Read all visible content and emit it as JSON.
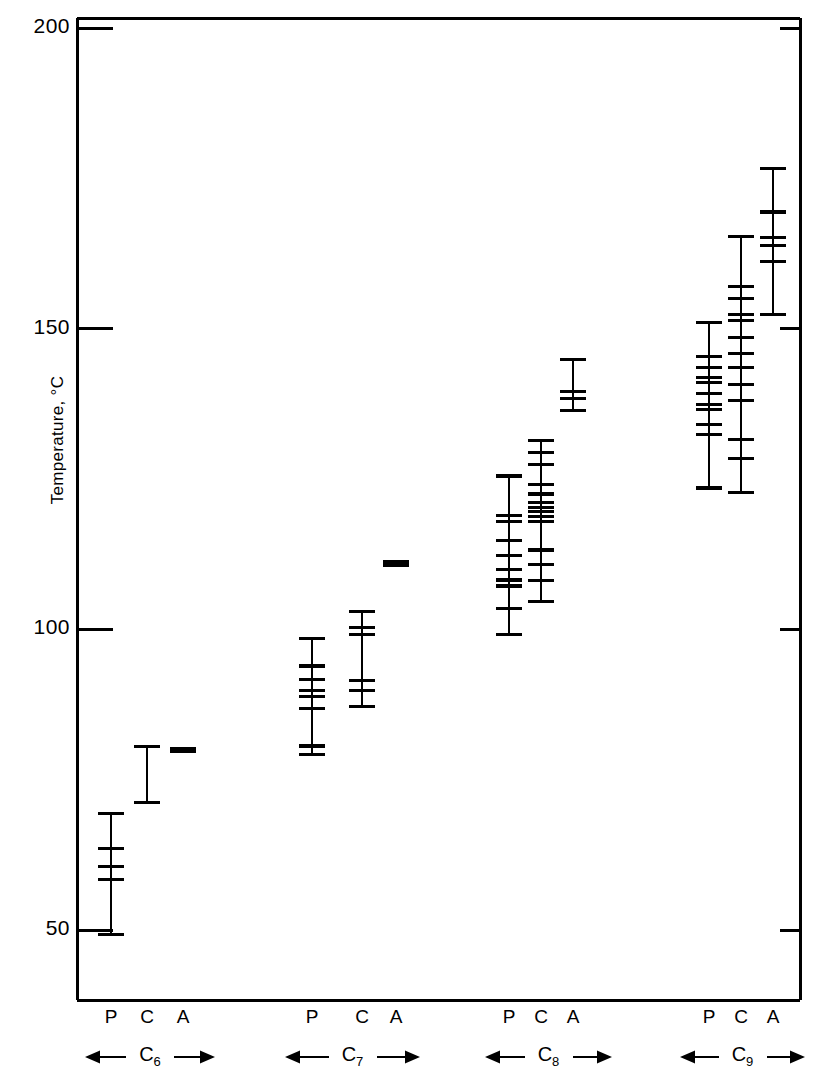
{
  "chart_data": {
    "type": "scatter",
    "subtype": "tick-strip-plot",
    "title": "",
    "xlabel": "",
    "ylabel": "Temperature, °C",
    "ylim": [
      38,
      203
    ],
    "yticks": [
      50,
      100,
      150,
      200
    ],
    "ytick_labels": [
      "50",
      "100",
      "150",
      "200"
    ],
    "grid": false,
    "legend": null,
    "x_group_labels": [
      "C6",
      "C7",
      "C8",
      "C9"
    ],
    "x_group_labels_display": [
      "C₆",
      "C₇",
      "C₈",
      "C₉"
    ],
    "x_subcategories": [
      "P",
      "C",
      "A"
    ],
    "series": [
      {
        "name": "C6 P",
        "group": "C6",
        "sub": "P",
        "range": [
          49.2,
          69.4
        ],
        "values": [
          69.4,
          63.6,
          60.6,
          58.4,
          49.2
        ]
      },
      {
        "name": "C6 C",
        "group": "C6",
        "sub": "C",
        "range": [
          71.2,
          80.5
        ],
        "values": [
          80.5,
          71.2
        ]
      },
      {
        "name": "C6 A",
        "group": "C6",
        "sub": "A",
        "range": [
          79.7,
          80.2
        ],
        "values": [
          80.2,
          79.7
        ]
      },
      {
        "name": "C7 P",
        "group": "C7",
        "sub": "P",
        "range": [
          79.2,
          98.5
        ],
        "values": [
          98.5,
          93.9,
          91.6,
          89.9,
          88.9,
          86.9,
          80.6,
          79.2
        ]
      },
      {
        "name": "C7 C",
        "group": "C7",
        "sub": "C",
        "range": [
          87.5,
          103.0
        ],
        "values": [
          103.0,
          100.3,
          99.2,
          91.5,
          89.9,
          87.1
        ]
      },
      {
        "name": "C7 A",
        "group": "C7",
        "sub": "A",
        "range": [
          110.6,
          111.2
        ],
        "values": [
          111.2,
          110.6
        ]
      },
      {
        "name": "C8 P",
        "group": "C8",
        "sub": "P",
        "range": [
          99.1,
          125.5
        ],
        "values": [
          125.5,
          118.9,
          117.9,
          114.8,
          112.3,
          110.0,
          108.2,
          107.2,
          103.4,
          99.1
        ]
      },
      {
        "name": "C8 C",
        "group": "C8",
        "sub": "C",
        "range": [
          104.7,
          131.4
        ],
        "values": [
          131.4,
          129.4,
          127.4,
          124.1,
          122.5,
          121.1,
          120.3,
          119.6,
          118.8,
          117.9,
          113.2,
          110.8,
          108.1,
          104.7
        ]
      },
      {
        "name": "C8 A",
        "group": "C8",
        "sub": "A",
        "range": [
          136.4,
          144.9
        ],
        "values": [
          144.9,
          139.6,
          138.4,
          136.4
        ]
      },
      {
        "name": "C9 P",
        "group": "C9",
        "sub": "P",
        "range": [
          123.5,
          151.0
        ],
        "values": [
          151.0,
          145.4,
          143.6,
          141.9,
          141.0,
          139.2,
          137.4,
          136.5,
          134.1,
          132.4,
          123.5
        ]
      },
      {
        "name": "C9 C",
        "group": "C9",
        "sub": "C",
        "range": [
          122.8,
          165.4
        ],
        "values": [
          165.4,
          157.0,
          155.0,
          152.3,
          151.4,
          148.5,
          145.8,
          143.5,
          140.7,
          138.1,
          131.6,
          128.4,
          122.8
        ]
      },
      {
        "name": "C9 A",
        "group": "C9",
        "sub": "A",
        "range": [
          152.3,
          176.7
        ],
        "values": [
          176.7,
          169.4,
          165.1,
          163.9,
          161.1,
          152.3
        ]
      }
    ]
  },
  "axis": {
    "y_title": "Temperature, ",
    "y_title_unit": "°C",
    "tick_200": "200",
    "tick_150": "150",
    "tick_100": "100",
    "tick_50": "50"
  },
  "groups": [
    {
      "label": "C",
      "sub": "6",
      "cols": [
        {
          "label": "P",
          "series": "C6 P"
        },
        {
          "label": "C",
          "series": "C6 C"
        },
        {
          "label": "A",
          "series": "C6 A"
        }
      ]
    },
    {
      "label": "C",
      "sub": "7",
      "cols": [
        {
          "label": "P",
          "series": "C7 P"
        },
        {
          "label": "C",
          "series": "C7 C"
        },
        {
          "label": "A",
          "series": "C7 A"
        }
      ]
    },
    {
      "label": "C",
      "sub": "8",
      "cols": [
        {
          "label": "P",
          "series": "C8 P"
        },
        {
          "label": "C",
          "series": "C8 C"
        },
        {
          "label": "A",
          "series": "C8 A"
        }
      ]
    },
    {
      "label": "C",
      "sub": "9",
      "cols": [
        {
          "label": "P",
          "series": "C9 P"
        },
        {
          "label": "C",
          "series": "C9 C"
        },
        {
          "label": "A",
          "series": "C9 A"
        }
      ]
    }
  ],
  "style": {
    "ink": "#000000",
    "paper": "#ffffff"
  }
}
